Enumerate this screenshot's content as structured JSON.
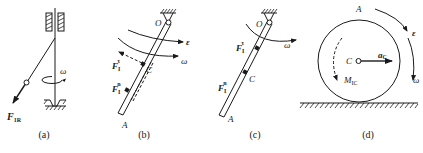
{
  "figure": {
    "panels": [
      {
        "id": "a",
        "caption": "(a)",
        "labels": {
          "force": "F",
          "force_sub": "1R",
          "omega": "ω"
        }
      },
      {
        "id": "b",
        "caption": "(b)",
        "labels": {
          "pivot": "O",
          "center": "C",
          "end": "A",
          "epsilon": "ε",
          "omega": "ω",
          "f_tau": "F",
          "f_tau_sub": "I",
          "f_tau_sup": "τ",
          "f_n": "F",
          "f_n_sub": "I",
          "f_n_sup": "n"
        }
      },
      {
        "id": "c",
        "caption": "(c)",
        "labels": {
          "pivot": "O",
          "center": "C",
          "end": "A",
          "omega": "ω",
          "f_tau": "F",
          "f_tau_sub": "I",
          "f_tau_sup": "τ",
          "f_n": "F",
          "f_n_sub": "I",
          "f_n_sup": "n"
        }
      },
      {
        "id": "d",
        "caption": "(d)",
        "labels": {
          "point": "A",
          "center": "C",
          "accel": "a",
          "accel_sub": "C",
          "moment": "M",
          "moment_sub": "IC",
          "epsilon": "ε",
          "omega": "ω"
        }
      }
    ],
    "colors": {
      "ink": "#1a1a1a",
      "background": "#ffffff"
    }
  }
}
